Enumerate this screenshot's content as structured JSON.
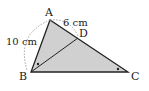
{
  "diagram": {
    "type": "geometry-triangle",
    "points": {
      "A": {
        "label": "A",
        "x": 50,
        "y": 20
      },
      "B": {
        "label": "B",
        "x": 31,
        "y": 72
      },
      "C": {
        "label": "C",
        "x": 128,
        "y": 72
      },
      "D": {
        "label": "D",
        "x": 78,
        "y": 38
      }
    },
    "lengths": {
      "AB": "10 cm",
      "AD": "6 cm"
    },
    "fill_color": "#d0d0d0",
    "stroke_color": "#222222",
    "dashed_color": "#999999",
    "angle_marks": [
      "ABD",
      "ACB"
    ]
  }
}
